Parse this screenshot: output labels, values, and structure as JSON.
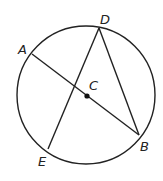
{
  "diagram": {
    "type": "circle-geometry",
    "circle": {
      "center": "C",
      "cx": 86,
      "cy": 95,
      "r": 69
    },
    "points": {
      "A": {
        "label": "A",
        "x": 32,
        "y": 54
      },
      "B": {
        "label": "B",
        "x": 139,
        "y": 135
      },
      "C": {
        "label": "C",
        "x": 87,
        "y": 96
      },
      "D": {
        "label": "D",
        "x": 99,
        "y": 28
      },
      "E": {
        "label": "E",
        "x": 48,
        "y": 149
      }
    },
    "segments": [
      "AB",
      "DE",
      "DB"
    ],
    "colors": {
      "stroke": "#222222",
      "background": "#ffffff"
    }
  }
}
